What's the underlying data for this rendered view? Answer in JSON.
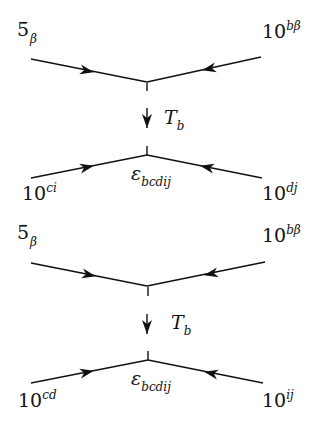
{
  "diagrams": [
    {
      "top_left": {
        "base": "5̄",
        "sub": "β",
        "sup": ""
      },
      "top_right": {
        "base": "10",
        "sup": "bβ"
      },
      "mediator": {
        "base": "T",
        "sub": "b"
      },
      "vertex_label": {
        "base": "ε",
        "sub": "bcdij"
      },
      "bottom_left": {
        "base": "10",
        "sup": "ci"
      },
      "bottom_right": {
        "base": "10",
        "sup": "dj"
      }
    },
    {
      "top_left": {
        "base": "5̄",
        "sub": "β",
        "sup": ""
      },
      "top_right": {
        "base": "10",
        "sup": "bβ"
      },
      "mediator": {
        "base": "T",
        "sub": "b"
      },
      "vertex_label": {
        "base": "ε",
        "sub": "bcdij"
      },
      "bottom_left": {
        "base": "10",
        "sup": "cd"
      },
      "bottom_right": {
        "base": "10",
        "sup": "ij"
      }
    }
  ],
  "colors": {
    "line": "#111111",
    "background": "#ffffff"
  }
}
